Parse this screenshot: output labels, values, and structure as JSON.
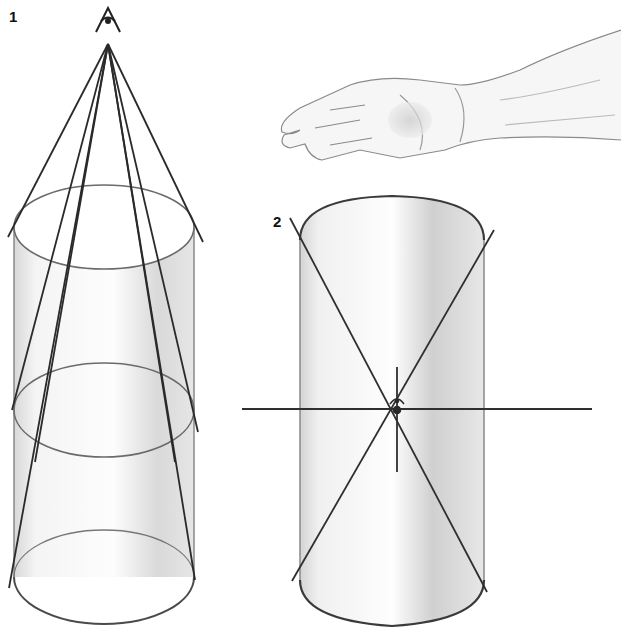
{
  "figure": {
    "labels": {
      "fig1": "1",
      "fig2": "2"
    },
    "colors": {
      "line": "#2a2a2a",
      "ellipse": "#555555",
      "shade": "#bdbdbd",
      "background": "#ffffff"
    }
  }
}
